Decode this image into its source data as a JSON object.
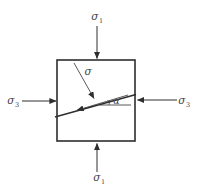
{
  "diagram": {
    "labels": {
      "sigma_top": {
        "base": "σ",
        "sub": "1"
      },
      "sigma_bottom": {
        "base": "σ",
        "sub": "1"
      },
      "sigma_left": {
        "base": "σ",
        "sub": "3"
      },
      "sigma_right": {
        "base": "σ",
        "sub": "3"
      },
      "sigma_plane": {
        "base": "σ"
      },
      "alpha": {
        "base": "α"
      }
    },
    "colors": {
      "line": "#2e2e2e",
      "text": "#444444",
      "background": "#ffffff"
    }
  }
}
